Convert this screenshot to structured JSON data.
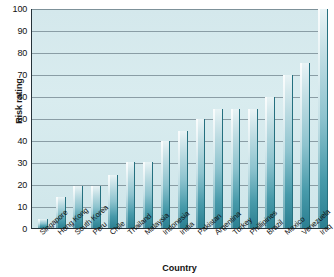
{
  "chart_data": {
    "type": "bar",
    "title": "",
    "xlabel": "Country",
    "ylabel": "Risk rating",
    "ylim": [
      0,
      100
    ],
    "ytick_step": 10,
    "yticks": [
      0,
      10,
      20,
      30,
      40,
      50,
      60,
      70,
      80,
      90,
      100
    ],
    "grid": true,
    "legend": "none",
    "bar_color": "#3e95a6",
    "plot_background": "#d6e9ed",
    "categories": [
      "Singapore",
      "Hong Kong",
      "South Korea",
      "Peru",
      "Chile",
      "Thailand",
      "Malaysia",
      "Indonesia",
      "India",
      "Pakistan",
      "Argentina",
      "Turkey",
      "Phillipines",
      "Brazil",
      "Mexico",
      "Venezuela",
      "Iraq"
    ],
    "values": [
      4,
      14,
      19,
      19,
      24,
      30,
      30,
      39.5,
      44,
      49.5,
      54,
      54,
      54,
      59.5,
      69.5,
      75,
      100
    ]
  }
}
